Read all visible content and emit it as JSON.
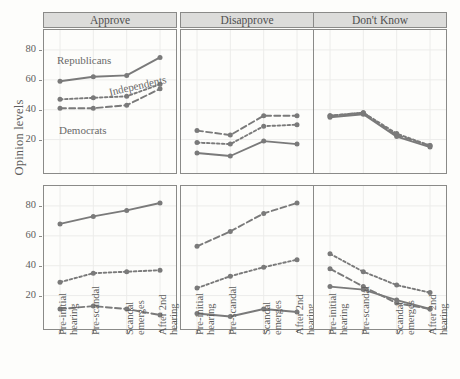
{
  "figure": {
    "ylabel": "Opinion levels",
    "column_strips": [
      "Approve",
      "Disapprove",
      "Don't Know"
    ],
    "row_strips": [
      "Thomas",
      "Kavanaugh"
    ],
    "series_annotations": {
      "republicans": "Republicans",
      "independents": "Independents",
      "democrats": "Democrats"
    },
    "colors": {
      "line": "#7a7a7a",
      "strip_fill": "#dcdcda",
      "strip_border": "#8a8a88",
      "panel_bg": "#fdfdfb",
      "grid": "#ececea",
      "text": "#5d5d5d"
    }
  },
  "chart_data": {
    "type": "line",
    "title": "",
    "xlabel": "",
    "ylabel": "Opinion levels",
    "ylim": [
      3,
      88
    ],
    "yticks": [
      20,
      40,
      60,
      80
    ],
    "grid": true,
    "legend": "in-plot annotations",
    "categories": [
      "Pre-initial hearing",
      "Pre-scandal",
      "Scandal emerges",
      "After 2nd hearing"
    ],
    "facets": {
      "columns": [
        "Approve",
        "Disapprove",
        "Don't Know"
      ],
      "rows": [
        "Thomas",
        "Kavanaugh"
      ]
    },
    "panels": [
      {
        "row": "Thomas",
        "column": "Approve",
        "series": [
          {
            "name": "Republicans",
            "style": "solid",
            "values": [
              59,
              62,
              63,
              75
            ]
          },
          {
            "name": "Independents",
            "style": "short-dash",
            "values": [
              47,
              48,
              49,
              57
            ]
          },
          {
            "name": "Democrats",
            "style": "long-dash",
            "values": [
              41,
              41,
              43,
              54
            ]
          }
        ]
      },
      {
        "row": "Thomas",
        "column": "Disapprove",
        "series": [
          {
            "name": "Republicans",
            "style": "solid",
            "values": [
              11,
              9,
              19,
              17
            ]
          },
          {
            "name": "Independents",
            "style": "short-dash",
            "values": [
              18,
              17,
              29,
              30
            ]
          },
          {
            "name": "Democrats",
            "style": "long-dash",
            "values": [
              26,
              23,
              36,
              36
            ]
          }
        ]
      },
      {
        "row": "Thomas",
        "column": "Don't Know",
        "series": [
          {
            "name": "Republicans",
            "style": "solid",
            "values": [
              35,
              37,
              22,
              15
            ]
          },
          {
            "name": "Independents",
            "style": "short-dash",
            "values": [
              36,
              38,
              24,
              16
            ]
          },
          {
            "name": "Democrats",
            "style": "long-dash",
            "values": [
              36,
              38,
              23,
              16
            ]
          }
        ]
      },
      {
        "row": "Kavanaugh",
        "column": "Approve",
        "series": [
          {
            "name": "Republicans",
            "style": "solid",
            "values": [
              68,
              73,
              77,
              82
            ]
          },
          {
            "name": "Independents",
            "style": "short-dash",
            "values": [
              29,
              35,
              36,
              37
            ]
          },
          {
            "name": "Democrats",
            "style": "long-dash",
            "values": [
              11,
              13,
              11,
              7
            ]
          }
        ]
      },
      {
        "row": "Kavanaugh",
        "column": "Disapprove",
        "series": [
          {
            "name": "Republicans",
            "style": "solid",
            "values": [
              8,
              6,
              11,
              9
            ]
          },
          {
            "name": "Independents",
            "style": "short-dash",
            "values": [
              25,
              33,
              39,
              44
            ]
          },
          {
            "name": "Democrats",
            "style": "long-dash",
            "values": [
              53,
              63,
              75,
              82
            ]
          }
        ]
      },
      {
        "row": "Kavanaugh",
        "column": "Don't Know",
        "series": [
          {
            "name": "Republicans",
            "style": "solid",
            "values": [
              26,
              24,
              17,
              11
            ]
          },
          {
            "name": "Independents",
            "style": "short-dash",
            "values": [
              48,
              36,
              27,
              22
            ]
          },
          {
            "name": "Democrats",
            "style": "long-dash",
            "values": [
              38,
              26,
              15,
              11
            ]
          }
        ]
      }
    ]
  }
}
